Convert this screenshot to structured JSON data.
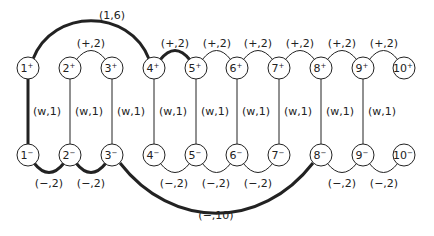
{
  "diagram": {
    "type": "graph",
    "node_radius": 11,
    "colors": {
      "stroke": "#222222",
      "fill": "#ffffff",
      "text": "#222222"
    },
    "nodes": [
      {
        "id": "1+",
        "num": "1",
        "sign": "+",
        "x": 28,
        "y": 68
      },
      {
        "id": "2+",
        "num": "2",
        "sign": "+",
        "x": 70,
        "y": 68
      },
      {
        "id": "3+",
        "num": "3",
        "sign": "+",
        "x": 112,
        "y": 68
      },
      {
        "id": "4+",
        "num": "4",
        "sign": "+",
        "x": 154,
        "y": 68
      },
      {
        "id": "5+",
        "num": "5",
        "sign": "+",
        "x": 196,
        "y": 68
      },
      {
        "id": "6+",
        "num": "6",
        "sign": "+",
        "x": 237,
        "y": 68
      },
      {
        "id": "7+",
        "num": "7",
        "sign": "+",
        "x": 279,
        "y": 68
      },
      {
        "id": "8+",
        "num": "8",
        "sign": "+",
        "x": 321,
        "y": 68
      },
      {
        "id": "9+",
        "num": "9",
        "sign": "+",
        "x": 363,
        "y": 68
      },
      {
        "id": "10+",
        "num": "10",
        "sign": "+",
        "x": 404,
        "y": 68
      },
      {
        "id": "1-",
        "num": "1",
        "sign": "−",
        "x": 28,
        "y": 155
      },
      {
        "id": "2-",
        "num": "2",
        "sign": "−",
        "x": 70,
        "y": 155
      },
      {
        "id": "3-",
        "num": "3",
        "sign": "−",
        "x": 112,
        "y": 155
      },
      {
        "id": "4-",
        "num": "4",
        "sign": "−",
        "x": 154,
        "y": 155
      },
      {
        "id": "5-",
        "num": "5",
        "sign": "−",
        "x": 196,
        "y": 155
      },
      {
        "id": "6-",
        "num": "6",
        "sign": "−",
        "x": 237,
        "y": 155
      },
      {
        "id": "7-",
        "num": "7",
        "sign": "−",
        "x": 279,
        "y": 155
      },
      {
        "id": "8-",
        "num": "8",
        "sign": "−",
        "x": 321,
        "y": 155
      },
      {
        "id": "9-",
        "num": "9",
        "sign": "−",
        "x": 363,
        "y": 155
      },
      {
        "id": "10-",
        "num": "10",
        "sign": "−",
        "x": 404,
        "y": 155
      }
    ],
    "edges": [
      {
        "from": "1+",
        "to": "4+",
        "label": "(1,6)",
        "kind": "arc-up",
        "bold": true,
        "label_x": 112,
        "label_y": 19
      },
      {
        "from": "2+",
        "to": "3+",
        "label": "(+,2)",
        "kind": "arc-up",
        "bold": false,
        "label_x": 91,
        "label_y": 47
      },
      {
        "from": "4+",
        "to": "5+",
        "label": "(+,2)",
        "kind": "arc-up",
        "bold": true,
        "label_x": 175,
        "label_y": 47
      },
      {
        "from": "5+",
        "to": "6+",
        "label": "(+,2)",
        "kind": "arc-up",
        "bold": false,
        "label_x": 217,
        "label_y": 47
      },
      {
        "from": "6+",
        "to": "7+",
        "label": "(+,2)",
        "kind": "arc-up",
        "bold": false,
        "label_x": 258,
        "label_y": 47
      },
      {
        "from": "7+",
        "to": "8+",
        "label": "(+,2)",
        "kind": "arc-up",
        "bold": false,
        "label_x": 300,
        "label_y": 47
      },
      {
        "from": "8+",
        "to": "9+",
        "label": "(+,2)",
        "kind": "arc-up",
        "bold": false,
        "label_x": 342,
        "label_y": 47
      },
      {
        "from": "9+",
        "to": "10+",
        "label": "(+,2)",
        "kind": "arc-up",
        "bold": false,
        "label_x": 384,
        "label_y": 47
      },
      {
        "from": "1+",
        "to": "1-",
        "label": "(w,1)",
        "kind": "vertical",
        "bold": true,
        "label_x": 47,
        "label_y": 115
      },
      {
        "from": "2+",
        "to": "2-",
        "label": "(w,1)",
        "kind": "vertical",
        "bold": false,
        "label_x": 89,
        "label_y": 115
      },
      {
        "from": "3+",
        "to": "3-",
        "label": "(w,1)",
        "kind": "vertical",
        "bold": false,
        "label_x": 131,
        "label_y": 115
      },
      {
        "from": "4+",
        "to": "4-",
        "label": "(w,1)",
        "kind": "vertical",
        "bold": false,
        "label_x": 173,
        "label_y": 115
      },
      {
        "from": "5+",
        "to": "5-",
        "label": "(w,1)",
        "kind": "vertical",
        "bold": false,
        "label_x": 215,
        "label_y": 115
      },
      {
        "from": "6+",
        "to": "6-",
        "label": "(w,1)",
        "kind": "vertical",
        "bold": false,
        "label_x": 256,
        "label_y": 115
      },
      {
        "from": "7+",
        "to": "7-",
        "label": "(w,1)",
        "kind": "vertical",
        "bold": false,
        "label_x": 298,
        "label_y": 115
      },
      {
        "from": "8+",
        "to": "8-",
        "label": "(w,1)",
        "kind": "vertical",
        "bold": false,
        "label_x": 340,
        "label_y": 115
      },
      {
        "from": "9+",
        "to": "9-",
        "label": "(w,1)",
        "kind": "vertical",
        "bold": false,
        "label_x": 382,
        "label_y": 115
      },
      {
        "from": "1-",
        "to": "2-",
        "label": "(−,2)",
        "kind": "arc-down",
        "bold": true,
        "label_x": 49,
        "label_y": 187
      },
      {
        "from": "2-",
        "to": "3-",
        "label": "(−,2)",
        "kind": "arc-down",
        "bold": true,
        "label_x": 91,
        "label_y": 187
      },
      {
        "from": "4-",
        "to": "5-",
        "label": "(−,2)",
        "kind": "arc-down",
        "bold": false,
        "label_x": 174,
        "label_y": 187
      },
      {
        "from": "5-",
        "to": "6-",
        "label": "(−,2)",
        "kind": "arc-down",
        "bold": false,
        "label_x": 216,
        "label_y": 187
      },
      {
        "from": "6-",
        "to": "7-",
        "label": "(−,2)",
        "kind": "arc-down",
        "bold": false,
        "label_x": 258,
        "label_y": 187
      },
      {
        "from": "8-",
        "to": "9-",
        "label": "(−,2)",
        "kind": "arc-down",
        "bold": false,
        "label_x": 342,
        "label_y": 187
      },
      {
        "from": "9-",
        "to": "10-",
        "label": "(−,2)",
        "kind": "arc-down",
        "bold": false,
        "label_x": 384,
        "label_y": 187
      },
      {
        "from": "3-",
        "to": "8-",
        "label": "(−,10)",
        "kind": "arc-down-large",
        "bold": true,
        "label_x": 216,
        "label_y": 219
      }
    ]
  }
}
